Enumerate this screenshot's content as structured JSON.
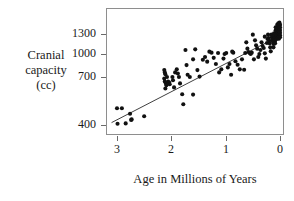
{
  "chart_data": {
    "type": "scatter",
    "title": "",
    "xlabel": "Age in Millions of Years",
    "ylabel": "Cranial capacity (cc)",
    "ylabel_lines": [
      "Cranial",
      "capacity",
      "(cc)"
    ],
    "xticks": [
      3,
      2,
      1,
      0
    ],
    "xtick_labels": [
      "3",
      "2",
      "1",
      "0"
    ],
    "yticks": [
      400,
      700,
      1000,
      1300
    ],
    "ytick_labels": [
      "400",
      "700",
      "1000",
      "1300"
    ],
    "xlim": [
      3.2,
      -0.08
    ],
    "x_axis_reversed": true,
    "grid": false,
    "legend": null,
    "marker_color": "#111111",
    "trendline": {
      "shown": true,
      "color": "#2a2a2a",
      "x_start": 3.1,
      "y_start": 415,
      "x_end": 0.05,
      "y_end": 1255
    },
    "points": [
      [
        3.0,
        505
      ],
      [
        2.91,
        505
      ],
      [
        2.99,
        408
      ],
      [
        2.84,
        410
      ],
      [
        2.76,
        470
      ],
      [
        2.73,
        435
      ],
      [
        2.74,
        432
      ],
      [
        2.5,
        455
      ],
      [
        2.13,
        790
      ],
      [
        2.12,
        760
      ],
      [
        2.11,
        735
      ],
      [
        2.13,
        690
      ],
      [
        2.12,
        672
      ],
      [
        2.1,
        660
      ],
      [
        2.09,
        648
      ],
      [
        2.11,
        628
      ],
      [
        2.08,
        700
      ],
      [
        2.06,
        672
      ],
      [
        2.04,
        665
      ],
      [
        2.03,
        655
      ],
      [
        1.98,
        700
      ],
      [
        1.97,
        680
      ],
      [
        1.95,
        635
      ],
      [
        1.93,
        760
      ],
      [
        1.9,
        800
      ],
      [
        1.88,
        745
      ],
      [
        1.86,
        700
      ],
      [
        1.84,
        660
      ],
      [
        1.8,
        592
      ],
      [
        1.78,
        530
      ],
      [
        1.74,
        1060
      ],
      [
        1.72,
        855
      ],
      [
        1.7,
        730
      ],
      [
        1.66,
        700
      ],
      [
        1.6,
        590
      ],
      [
        1.52,
        790
      ],
      [
        1.48,
        705
      ],
      [
        1.42,
        925
      ],
      [
        1.38,
        960
      ],
      [
        1.34,
        900
      ],
      [
        1.3,
        1035
      ],
      [
        1.26,
        1020
      ],
      [
        1.22,
        950
      ],
      [
        1.18,
        870
      ],
      [
        1.12,
        760
      ],
      [
        1.08,
        800
      ],
      [
        1.04,
        940
      ],
      [
        1.02,
        1000
      ],
      [
        0.99,
        1015
      ],
      [
        0.96,
        825
      ],
      [
        0.93,
        870
      ],
      [
        0.9,
        730
      ],
      [
        0.86,
        1020
      ],
      [
        0.82,
        905
      ],
      [
        0.78,
        860
      ],
      [
        0.74,
        800
      ],
      [
        0.7,
        930
      ],
      [
        0.66,
        795
      ],
      [
        0.62,
        1175
      ],
      [
        0.6,
        1080
      ],
      [
        0.58,
        1030
      ],
      [
        0.56,
        1015
      ],
      [
        0.54,
        1000
      ],
      [
        0.52,
        1020
      ],
      [
        0.5,
        1290
      ],
      [
        0.46,
        1205
      ],
      [
        0.44,
        1130
      ],
      [
        0.42,
        1080
      ],
      [
        0.4,
        960
      ],
      [
        0.38,
        1000
      ],
      [
        0.34,
        1175
      ],
      [
        0.32,
        1120
      ],
      [
        0.3,
        1090
      ],
      [
        0.28,
        1010
      ],
      [
        0.26,
        940
      ],
      [
        0.24,
        1165
      ],
      [
        0.23,
        1225
      ],
      [
        0.22,
        1290
      ],
      [
        0.21,
        1240
      ],
      [
        0.2,
        1200
      ],
      [
        0.19,
        1160
      ],
      [
        0.18,
        1100
      ],
      [
        0.17,
        1040
      ],
      [
        0.16,
        1290
      ],
      [
        0.15,
        1250
      ],
      [
        0.14,
        1215
      ],
      [
        0.13,
        1185
      ],
      [
        0.12,
        1150
      ],
      [
        0.12,
        1100
      ],
      [
        0.11,
        1310
      ],
      [
        0.1,
        1270
      ],
      [
        0.1,
        1230
      ],
      [
        0.09,
        1200
      ],
      [
        0.09,
        1160
      ],
      [
        0.08,
        1400
      ],
      [
        0.08,
        1355
      ],
      [
        0.07,
        1320
      ],
      [
        0.07,
        1290
      ],
      [
        0.06,
        1260
      ],
      [
        0.06,
        1225
      ],
      [
        0.05,
        1440
      ],
      [
        0.05,
        1390
      ],
      [
        0.05,
        1350
      ],
      [
        0.04,
        1310
      ],
      [
        0.04,
        1275
      ],
      [
        0.04,
        1240
      ],
      [
        0.03,
        1460
      ],
      [
        0.03,
        1420
      ],
      [
        0.03,
        1380
      ],
      [
        0.02,
        1340
      ],
      [
        0.02,
        1300
      ],
      [
        0.02,
        1265
      ],
      [
        0.02,
        1230
      ],
      [
        0.01,
        1470
      ],
      [
        0.01,
        1430
      ],
      [
        0.01,
        1390
      ],
      [
        0.01,
        1350
      ],
      [
        0.01,
        1305
      ],
      [
        0.0,
        1440
      ],
      [
        0.0,
        1400
      ],
      [
        0.0,
        1360
      ],
      [
        0.0,
        1320
      ],
      [
        0.0,
        1280
      ],
      [
        0.0,
        1250
      ],
      [
        0.28,
        1260
      ],
      [
        0.36,
        1060
      ],
      [
        0.48,
        930
      ],
      [
        0.64,
        1015
      ],
      [
        0.88,
        1035
      ],
      [
        1.14,
        1015
      ],
      [
        1.56,
        1070
      ],
      [
        1.6,
        930
      ]
    ]
  }
}
